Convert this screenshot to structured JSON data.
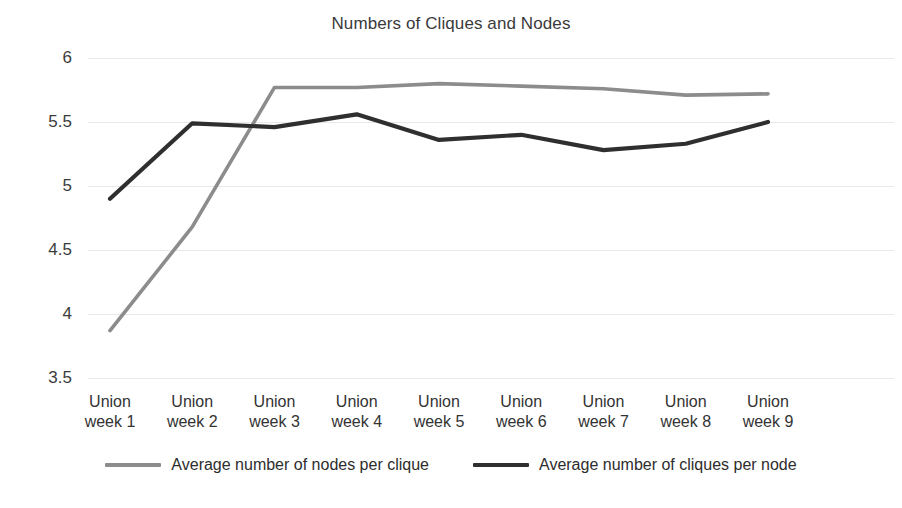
{
  "chart_data": {
    "type": "line",
    "title": "Numbers of Cliques and Nodes",
    "xlabel": "",
    "ylabel": "",
    "ylim": [
      3.5,
      6
    ],
    "ytick_step": 0.5,
    "yticks": [
      "3.5",
      "4",
      "4.5",
      "5",
      "5.5",
      "6"
    ],
    "grid": true,
    "legend_position": "bottom",
    "categories": [
      "Union week 1",
      "Union week 2",
      "Union week 3",
      "Union week 4",
      "Union week 5",
      "Union week 6",
      "Union week 7",
      "Union week 8",
      "Union week 9"
    ],
    "category_lines": [
      [
        "Union",
        "week 1"
      ],
      [
        "Union",
        "week 2"
      ],
      [
        "Union",
        "week 3"
      ],
      [
        "Union",
        "week 4"
      ],
      [
        "Union",
        "week 5"
      ],
      [
        "Union",
        "week 6"
      ],
      [
        "Union",
        "week 7"
      ],
      [
        "Union",
        "week 8"
      ],
      [
        "Union",
        "week 9"
      ]
    ],
    "series": [
      {
        "name": "Average number of nodes per clique",
        "color": "#8c8c8c",
        "values": [
          3.87,
          4.68,
          5.77,
          5.77,
          5.8,
          5.78,
          5.76,
          5.71,
          5.72
        ]
      },
      {
        "name": "Average number of cliques per node",
        "color": "#2f2f2f",
        "values": [
          4.9,
          5.49,
          5.46,
          5.56,
          5.36,
          5.4,
          5.28,
          5.33,
          5.5
        ]
      }
    ]
  },
  "legend": {
    "items": [
      {
        "label": "Average number of nodes per clique",
        "color": "#8c8c8c"
      },
      {
        "label": "Average number of cliques per node",
        "color": "#2f2f2f"
      }
    ]
  }
}
